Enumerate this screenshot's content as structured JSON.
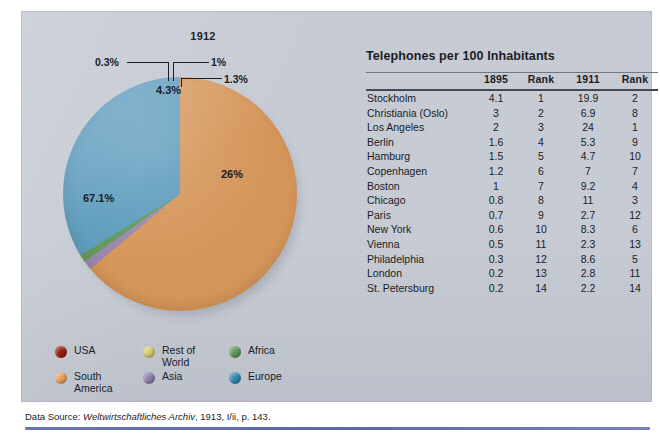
{
  "figure": {
    "pie_title": "1912",
    "table_title": "Telephones per 100 Inhabitants",
    "source_prefix": "Data Source: ",
    "source_journal": "Weltwirtschaftliches Archiv",
    "source_suffix": ", 1913, I/ii, p. 143."
  },
  "chart_data": {
    "type": "pie",
    "title": "1912",
    "legend_position": "bottom-left",
    "categories": [
      "USA",
      "South America",
      "Rest of World",
      "Asia",
      "Africa",
      "Europe"
    ],
    "values": [
      0.3,
      67.1,
      4.3,
      1.3,
      1.0,
      26.0
    ],
    "labels": [
      "0.3%",
      "67.1%",
      "4.3%",
      "1.3%",
      "1%",
      "26%"
    ],
    "colors": [
      "#991709",
      "#d79557",
      "#ece3b4",
      "#9b86ae",
      "#5e9a58",
      "#5c9cbe"
    ],
    "slice_order": [
      "USA",
      "Rest of World",
      "South America",
      "Asia",
      "Africa",
      "Europe"
    ],
    "annotations": [
      "0.3%",
      "1%",
      "1.3%",
      "4.3%",
      "26%",
      "67.1%"
    ]
  },
  "legend": {
    "items": [
      {
        "label": "USA",
        "color": "#991709"
      },
      {
        "label": "Rest of\nWorld",
        "color": "#d9d173"
      },
      {
        "label": "Africa",
        "color": "#5e9a58"
      },
      {
        "label": "South\nAmerica",
        "color": "#eda45e"
      },
      {
        "label": "Asia",
        "color": "#8f7fad"
      },
      {
        "label": "Europe",
        "color": "#2f87ad"
      }
    ]
  },
  "table": {
    "title": "Telephones per 100 Inhabitants",
    "columns": [
      "",
      "1895",
      "Rank",
      "1911",
      "Rank"
    ],
    "rows": [
      {
        "city": "Stockholm",
        "v1895": "4.1",
        "r1895": "1",
        "v1911": "19.9",
        "r1911": "2"
      },
      {
        "city": "Christiania (Oslo)",
        "v1895": "3",
        "r1895": "2",
        "v1911": "6.9",
        "r1911": "8"
      },
      {
        "city": "Los Angeles",
        "v1895": "2",
        "r1895": "3",
        "v1911": "24",
        "r1911": "1"
      },
      {
        "city": "Berlin",
        "v1895": "1.6",
        "r1895": "4",
        "v1911": "5.3",
        "r1911": "9"
      },
      {
        "city": "Hamburg",
        "v1895": "1.5",
        "r1895": "5",
        "v1911": "4.7",
        "r1911": "10"
      },
      {
        "city": "Copenhagen",
        "v1895": "1.2",
        "r1895": "6",
        "v1911": "7",
        "r1911": "7"
      },
      {
        "city": "Boston",
        "v1895": "1",
        "r1895": "7",
        "v1911": "9.2",
        "r1911": "4"
      },
      {
        "city": "Chicago",
        "v1895": "0.8",
        "r1895": "8",
        "v1911": "11",
        "r1911": "3"
      },
      {
        "city": "Paris",
        "v1895": "0.7",
        "r1895": "9",
        "v1911": "2.7",
        "r1911": "12"
      },
      {
        "city": "New York",
        "v1895": "0.6",
        "r1895": "10",
        "v1911": "8.3",
        "r1911": "6"
      },
      {
        "city": "Vienna",
        "v1895": "0.5",
        "r1895": "11",
        "v1911": "2.3",
        "r1911": "13"
      },
      {
        "city": "Philadelphia",
        "v1895": "0.3",
        "r1895": "12",
        "v1911": "8.6",
        "r1911": "5"
      },
      {
        "city": "London",
        "v1895": "0.2",
        "r1895": "13",
        "v1911": "2.8",
        "r1911": "11"
      },
      {
        "city": "St. Petersburg",
        "v1895": "0.2",
        "r1895": "14",
        "v1911": "2.2",
        "r1911": "14"
      }
    ]
  }
}
